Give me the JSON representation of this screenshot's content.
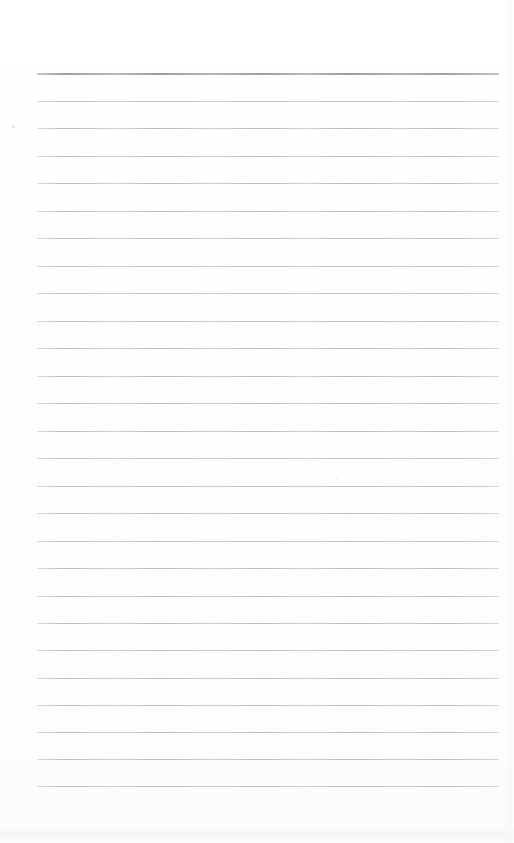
{
  "document": {
    "kind": "scanned-lined-paper",
    "page_width": 514,
    "page_height": 843,
    "background_color": "#fefefe",
    "text_content": "",
    "is_blank": "true"
  },
  "ruling": {
    "line_color": "#b7b7b7",
    "header_line_color": "#9c9c9c",
    "line_left_x": 37,
    "line_right_x": 499,
    "line_width": 462,
    "line_spacing": 27.45,
    "first_line_y": 73,
    "last_line_y": 786,
    "line_count": 27,
    "header_line_thickness": 2,
    "body_line_thickness": 1,
    "lines": [
      {
        "index": 0,
        "y": 73,
        "type": "header",
        "thickness": 2,
        "color": "#9c9c9c"
      },
      {
        "index": 1,
        "y": 101,
        "type": "body",
        "thickness": 1,
        "color": "#b7b7b7"
      },
      {
        "index": 2,
        "y": 128,
        "type": "body",
        "thickness": 1,
        "color": "#b7b7b7"
      },
      {
        "index": 3,
        "y": 156,
        "type": "body",
        "thickness": 1,
        "color": "#b7b7b7"
      },
      {
        "index": 4,
        "y": 183,
        "type": "body",
        "thickness": 1,
        "color": "#b7b7b7"
      },
      {
        "index": 5,
        "y": 211,
        "type": "body",
        "thickness": 1,
        "color": "#b7b7b7"
      },
      {
        "index": 6,
        "y": 238,
        "type": "body",
        "thickness": 1,
        "color": "#b7b7b7"
      },
      {
        "index": 7,
        "y": 266,
        "type": "body",
        "thickness": 1,
        "color": "#b7b7b7"
      },
      {
        "index": 8,
        "y": 293,
        "type": "body",
        "thickness": 1,
        "color": "#b7b7b7"
      },
      {
        "index": 9,
        "y": 321,
        "type": "body",
        "thickness": 1,
        "color": "#b7b7b7"
      },
      {
        "index": 10,
        "y": 348,
        "type": "body",
        "thickness": 1,
        "color": "#b7b7b7"
      },
      {
        "index": 11,
        "y": 376,
        "type": "body",
        "thickness": 1,
        "color": "#b7b7b7"
      },
      {
        "index": 12,
        "y": 403,
        "type": "body",
        "thickness": 1,
        "color": "#b7b7b7"
      },
      {
        "index": 13,
        "y": 431,
        "type": "body",
        "thickness": 1,
        "color": "#b7b7b7"
      },
      {
        "index": 14,
        "y": 458,
        "type": "body",
        "thickness": 1,
        "color": "#b7b7b7"
      },
      {
        "index": 15,
        "y": 486,
        "type": "body",
        "thickness": 1,
        "color": "#b7b7b7"
      },
      {
        "index": 16,
        "y": 513,
        "type": "body",
        "thickness": 1,
        "color": "#b7b7b7"
      },
      {
        "index": 17,
        "y": 541,
        "type": "body",
        "thickness": 1,
        "color": "#b7b7b7"
      },
      {
        "index": 18,
        "y": 568,
        "type": "body",
        "thickness": 1,
        "color": "#b7b7b7"
      },
      {
        "index": 19,
        "y": 596,
        "type": "body",
        "thickness": 1,
        "color": "#b7b7b7"
      },
      {
        "index": 20,
        "y": 623,
        "type": "body",
        "thickness": 1,
        "color": "#b7b7b7"
      },
      {
        "index": 21,
        "y": 650,
        "type": "body",
        "thickness": 1,
        "color": "#b7b7b7"
      },
      {
        "index": 22,
        "y": 678,
        "type": "body",
        "thickness": 1,
        "color": "#b7b7b7"
      },
      {
        "index": 23,
        "y": 705,
        "type": "body",
        "thickness": 1,
        "color": "#b7b7b7"
      },
      {
        "index": 24,
        "y": 732,
        "type": "body",
        "thickness": 1,
        "color": "#b7b7b7"
      },
      {
        "index": 25,
        "y": 759,
        "type": "body",
        "thickness": 1,
        "color": "#b7b7b7"
      },
      {
        "index": 26,
        "y": 786,
        "type": "body",
        "thickness": 1,
        "color": "#b7b7b7"
      }
    ]
  },
  "artifacts": {
    "bottom_noise_band": {
      "y": 826,
      "height": 18,
      "color": "#f5f5f5"
    },
    "right_edge_shade": {
      "x": 504,
      "width": 10,
      "color": "#f8f8f8"
    },
    "specks": [
      {
        "x": 12,
        "y": 125,
        "size": 3,
        "color": "#e2e2e2"
      },
      {
        "x": 336,
        "y": 477,
        "size": 2,
        "color": "#ececec"
      }
    ]
  }
}
